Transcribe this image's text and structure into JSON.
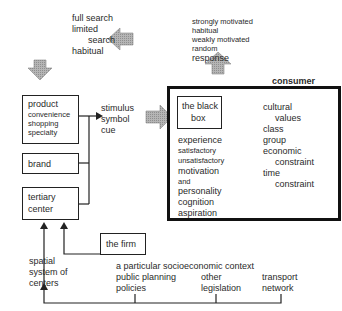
{
  "search": {
    "lines": [
      "full search",
      "limited",
      "search",
      "habitual"
    ]
  },
  "response": {
    "lines": [
      "strongly motivated",
      "habitual",
      "weakly motivated",
      "random",
      "response"
    ]
  },
  "product": {
    "title": "product",
    "items": [
      "convenience",
      "shopping",
      "specialty"
    ]
  },
  "brand": {
    "label": "brand"
  },
  "tertiary": {
    "lines": [
      "tertiary",
      "center"
    ]
  },
  "stimulus": {
    "lines": [
      "stimulus",
      "symbol",
      "cue"
    ]
  },
  "firm": {
    "label": "the firm"
  },
  "consumer": {
    "title": "consumer",
    "black_box": [
      "the black",
      "box"
    ],
    "left_items": [
      "experience",
      "satisfactory",
      "unsatisfactory",
      "motivation",
      "and",
      "personality",
      "cognition",
      "aspiration"
    ],
    "right_items": [
      "cultural",
      "values",
      "class",
      "group",
      "economic",
      "constraint",
      "time",
      "constraint"
    ]
  },
  "spatial": {
    "lines": [
      "spatial",
      "system of",
      "centers"
    ]
  },
  "context": {
    "title": "a particular socioeconomic context",
    "public": [
      "public planning",
      "policies"
    ],
    "other": [
      "other",
      "legislation"
    ],
    "transport": [
      "transport",
      "network"
    ]
  },
  "colors": {
    "arrow_fill": "#a8a8a8",
    "line": "#222222"
  }
}
